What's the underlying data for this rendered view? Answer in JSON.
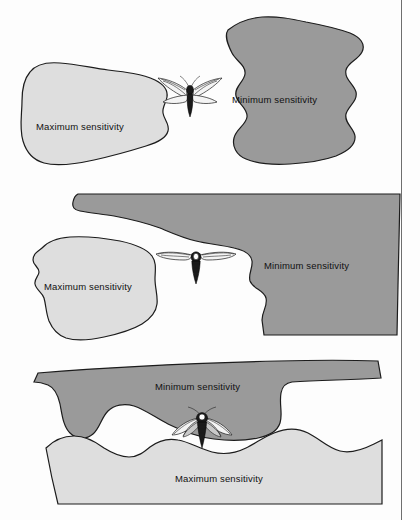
{
  "figure": {
    "background_color": "#fdfdfd",
    "frame_color": "#6e6e6e",
    "colors": {
      "maximum_sensitivity_fill": "#dedede",
      "minimum_sensitivity_fill": "#9a9a9a",
      "outline": "#1c1c1c",
      "text": "#111111"
    },
    "subject_icon": "moth-icon",
    "panel_count": 3
  },
  "panels": [
    {
      "id": "panel-1",
      "view": "top-view",
      "moth_orientation": "head-up-wings-spread",
      "regions": [
        {
          "name": "maximum-sensitivity-zone",
          "label": "Maximum sensitivity",
          "side": "left",
          "fill": "#dedede"
        },
        {
          "name": "minimum-sensitivity-zone",
          "label": "Minimum sensitivity",
          "side": "right",
          "fill": "#9a9a9a"
        }
      ]
    },
    {
      "id": "panel-2",
      "view": "front-view",
      "moth_orientation": "wings-horizontal",
      "regions": [
        {
          "name": "maximum-sensitivity-zone",
          "label": "Maximum sensitivity",
          "side": "left",
          "fill": "#dedede"
        },
        {
          "name": "minimum-sensitivity-zone",
          "label": "Minimum sensitivity",
          "side": "right",
          "fill": "#9a9a9a"
        }
      ]
    },
    {
      "id": "panel-3",
      "view": "side-view",
      "moth_orientation": "wings-swept-back",
      "regions": [
        {
          "name": "minimum-sensitivity-zone",
          "label": "Minimum sensitivity",
          "side": "top",
          "fill": "#9a9a9a"
        },
        {
          "name": "maximum-sensitivity-zone",
          "label": "Maximum sensitivity",
          "side": "bottom",
          "fill": "#dedede"
        }
      ]
    }
  ]
}
